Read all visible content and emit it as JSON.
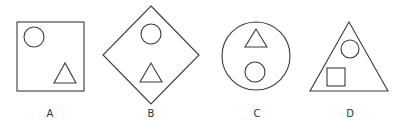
{
  "figures": [
    {
      "label": "A",
      "outer": "square",
      "inner": [
        "circle",
        "triangle"
      ]
    },
    {
      "label": "B",
      "outer": "diamond",
      "inner": [
        "circle",
        "triangle"
      ]
    },
    {
      "label": "C",
      "outer": "circle",
      "inner": [
        "triangle",
        "circle"
      ]
    },
    {
      "label": "D",
      "outer": "triangle",
      "inner": [
        "circle",
        "square"
      ]
    }
  ],
  "colors": {
    "stroke": "#3a3a3a",
    "background": "#ffffff"
  }
}
